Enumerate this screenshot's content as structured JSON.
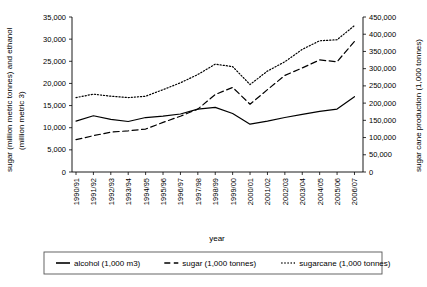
{
  "chart_data": {
    "type": "line",
    "title": "",
    "xlabel": "year",
    "ylabel": "sugar (million metric tonnes) and ethanol (million metric 3)",
    "y2label": "sugar cane production (1,000 tonnes)",
    "grid": false,
    "legend_position": "bottom",
    "ylim": [
      0,
      35000
    ],
    "y2lim": [
      0,
      450000
    ],
    "yticks": [
      "0",
      "5,000",
      "10,000",
      "15,000",
      "20,000",
      "25,000",
      "30,000",
      "35,000"
    ],
    "ytick_values": [
      0,
      5000,
      10000,
      15000,
      20000,
      25000,
      30000,
      35000
    ],
    "y2ticks": [
      "0",
      "50,000",
      "100,000",
      "150,000",
      "200,000",
      "250,000",
      "300,000",
      "350,000",
      "400,000",
      "450,000"
    ],
    "y2tick_values": [
      0,
      50000,
      100000,
      150000,
      200000,
      250000,
      300000,
      350000,
      400000,
      450000
    ],
    "categories": [
      "1990/91",
      "1991/92",
      "1992/93",
      "1993/94",
      "1994/95",
      "1995/96",
      "1996/97",
      "1997/98",
      "1998/99",
      "1999/00",
      "2000/01",
      "2001/02",
      "2002/03",
      "2003/04",
      "2004/05",
      "2005/06",
      "2006/07"
    ],
    "series": [
      {
        "name": "alcohol (1,000 m3)",
        "style": "solid",
        "axis": "left",
        "values": [
          11500,
          12700,
          11900,
          11400,
          12300,
          12600,
          13100,
          14200,
          14600,
          13200,
          10800,
          11500,
          12300,
          13000,
          13700,
          14200,
          17000
        ]
      },
      {
        "name": "sugar (1,000 tonnes)",
        "style": "dashed",
        "axis": "left",
        "values": [
          7300,
          8200,
          9000,
          9300,
          9700,
          11200,
          12600,
          14200,
          17500,
          19100,
          15300,
          18600,
          21800,
          23500,
          25300,
          24900,
          29500
        ]
      },
      {
        "name": "sugarcane (1,000 tonnes)",
        "style": "dotted",
        "axis": "right",
        "values": [
          216000,
          226000,
          220000,
          216000,
          220000,
          239000,
          259000,
          283000,
          313000,
          306000,
          254000,
          293000,
          320000,
          356000,
          381000,
          384000,
          425000
        ]
      }
    ]
  },
  "legend": {
    "items": [
      {
        "label": "alcohol (1,000 m3)",
        "style": "solid"
      },
      {
        "label": "sugar (1,000 tonnes)",
        "style": "dashed"
      },
      {
        "label": "sugarcane (1,000 tonnes)",
        "style": "dotted"
      }
    ]
  }
}
